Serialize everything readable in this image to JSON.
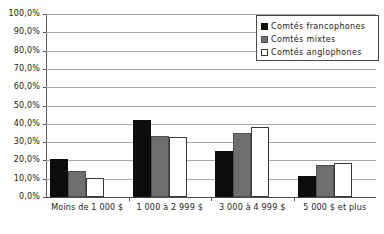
{
  "chart_data": {
    "type": "bar",
    "title": "",
    "xlabel": "",
    "ylabel": "",
    "ylim": [
      0,
      100
    ],
    "ytick_labels": [
      "100,0%",
      "90,0%",
      "80,0%",
      "70,0%",
      "60,0%",
      "50,0%",
      "40,0%",
      "30,0%",
      "20,0%",
      "10,0%",
      "0,0%"
    ],
    "ytick_values": [
      100,
      90,
      80,
      70,
      60,
      50,
      40,
      30,
      20,
      10,
      0
    ],
    "grid": true,
    "legend_position": "top-right",
    "categories": [
      "Moins de 1 000 $",
      "1 000 à 2 999 $",
      "3 000 à 4 999 $",
      "5 000 $ et plus"
    ],
    "series": [
      {
        "name": "Comtés francophones",
        "color": "#0d0d0d",
        "values": [
          21.0,
          42.3,
          25.0,
          11.7
        ]
      },
      {
        "name": "Comtés mixtes",
        "color": "#6e6e6e",
        "values": [
          14.2,
          33.6,
          35.2,
          17.4
        ]
      },
      {
        "name": "Comtés anglophones",
        "color": "#ffffff",
        "values": [
          10.6,
          33.0,
          38.4,
          18.4
        ]
      }
    ]
  }
}
